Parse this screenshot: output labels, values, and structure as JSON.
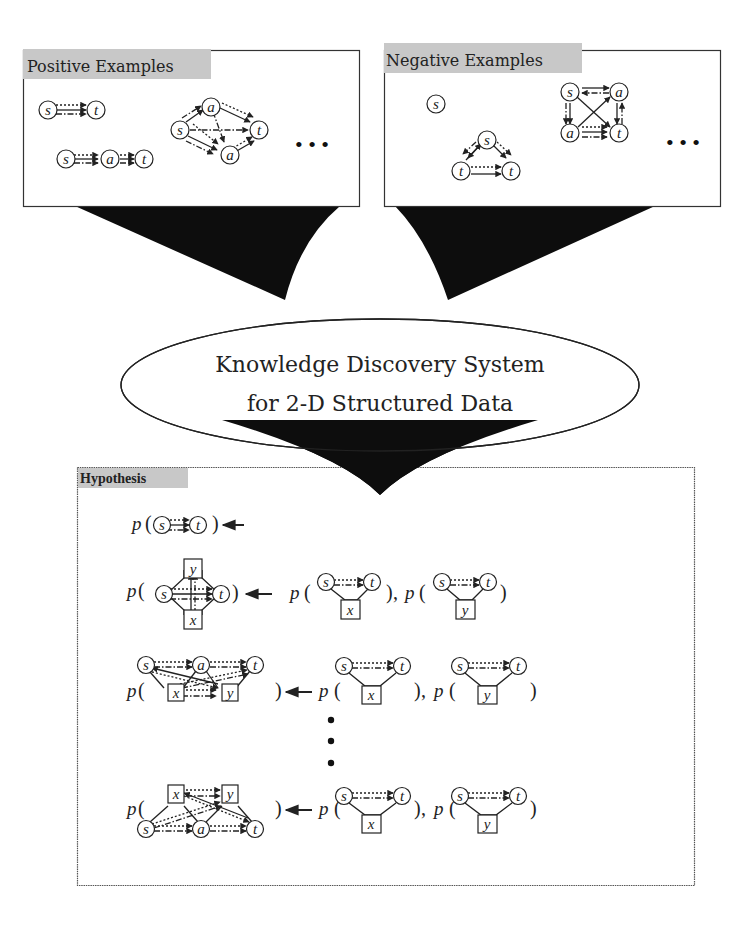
{
  "positive_panel": {
    "title": "Positive Examples",
    "examples": [
      {
        "nodes": [
          "s",
          "t"
        ]
      },
      {
        "nodes": [
          "s",
          "a",
          "t"
        ]
      },
      {
        "nodes": [
          "s",
          "a",
          "a",
          "t"
        ]
      }
    ],
    "ellipsis": "• • •"
  },
  "negative_panel": {
    "title": "Negative Examples",
    "examples": [
      {
        "nodes": [
          "s"
        ]
      },
      {
        "nodes": [
          "s",
          "t",
          "t"
        ]
      },
      {
        "nodes": [
          "s",
          "a",
          "a",
          "t"
        ]
      }
    ],
    "ellipsis": "• • •"
  },
  "system": {
    "line1": "Knowledge Discovery System",
    "line2": "for 2-D Structured Data"
  },
  "hypothesis_panel": {
    "title": "Hypothesis",
    "predicate": "p",
    "open_paren": "(",
    "close_paren": ")",
    "comma": ",",
    "vertical_ellipsis": "⋮",
    "rules": [
      {
        "head_nodes": [
          "s",
          "t"
        ],
        "body": []
      },
      {
        "head_nodes": [
          "s",
          "t",
          "y",
          "x"
        ],
        "body": [
          {
            "nodes": [
              "s",
              "t",
              "x"
            ]
          },
          {
            "nodes": [
              "s",
              "t",
              "y"
            ]
          }
        ]
      },
      {
        "head_nodes": [
          "s",
          "a",
          "t",
          "x",
          "y"
        ],
        "body": [
          {
            "nodes": [
              "s",
              "t",
              "x"
            ]
          },
          {
            "nodes": [
              "s",
              "t",
              "y"
            ]
          }
        ]
      },
      {
        "head_nodes": [
          "x",
          "y",
          "s",
          "a",
          "t"
        ],
        "body": [
          {
            "nodes": [
              "s",
              "t",
              "x"
            ]
          },
          {
            "nodes": [
              "s",
              "t",
              "y"
            ]
          }
        ]
      }
    ]
  },
  "labels": {
    "s": "s",
    "t": "t",
    "a": "a",
    "x": "x",
    "y": "y"
  },
  "colors": {
    "title_bg": "#c8c8c8",
    "funnel": "#0d0d0d",
    "ink": "#222222"
  }
}
